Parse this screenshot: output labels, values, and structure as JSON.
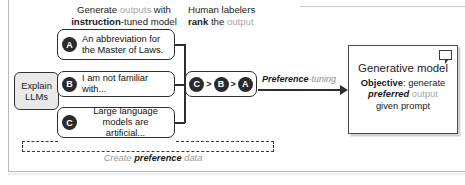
{
  "headings": {
    "generate": {
      "line1_a": "Generate ",
      "line1_gray": "outputs",
      "line1_b": " with",
      "line2_bold": "instruction",
      "line2_rest": "-tuned model"
    },
    "rank": {
      "line1": "Human labelers",
      "line2_bold": "rank",
      "line2_mid": " the ",
      "line2_gray": "output"
    }
  },
  "prompt": {
    "label": "Explain LLMs"
  },
  "options": [
    {
      "letter": "A",
      "text": "An abbreviation for the Master of Laws."
    },
    {
      "letter": "B",
      "text": "I am not familiar with..."
    },
    {
      "letter": "C",
      "text": "Large language models are artificial..."
    }
  ],
  "ranking": {
    "items": [
      "C",
      "B",
      "A"
    ],
    "separator": ">"
  },
  "arrow": {
    "label_bold_italic": "Preference",
    "label_gray": "-tuning"
  },
  "generative_model": {
    "title": "Generative model",
    "objective_label": "Objective",
    "objective_colon": ": generate",
    "preferred": "preferred",
    "output_gray": " output",
    "given_prompt": "given prompt",
    "icon": "speech-bubble-icon"
  },
  "dashed_region": {
    "caption_a": "Create ",
    "caption_bold": "preference",
    "caption_gray": " data"
  },
  "colors": {
    "ink": "#1a1a1a",
    "gray_text": "#a8a8a8",
    "badge_fill": "#2b2b2b",
    "prompt_fill": "#e9e9e9",
    "border": "#2e2e2e"
  }
}
